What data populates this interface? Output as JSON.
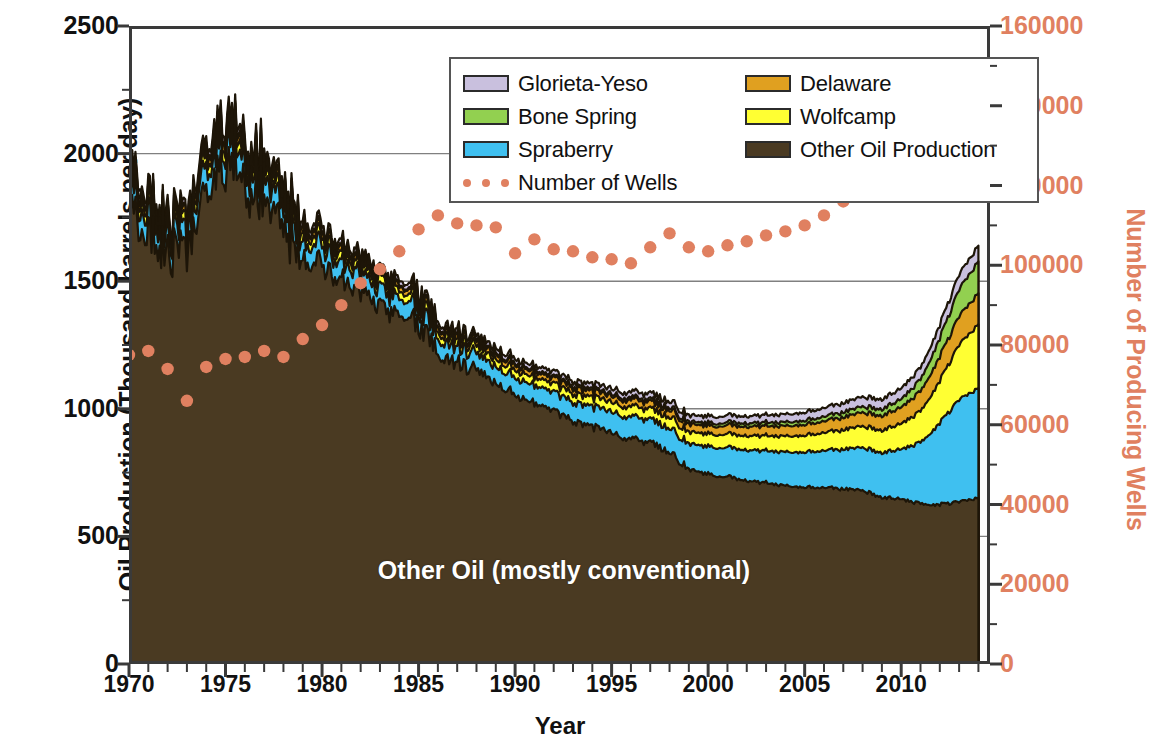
{
  "chart_data": {
    "type": "area",
    "title": "",
    "xlabel": "Year",
    "ylabel": "Oil Production (Thousand barrels per day)",
    "y2label": "Number of Producing Wells",
    "xlim": [
      1970,
      2014.6
    ],
    "ylim": [
      0,
      2500
    ],
    "y2lim": [
      0,
      160000
    ],
    "grid": "horizontal gridlines at 500/1000/1500/2000",
    "legend_position": "top-center inside plot",
    "xticks": [
      "1970",
      "1975",
      "1980",
      "1985",
      "1990",
      "1995",
      "2000",
      "2005",
      "2010"
    ],
    "xtick_values": [
      1970,
      1975,
      1980,
      1985,
      1990,
      1995,
      2000,
      2005,
      2010
    ],
    "yticks": [
      "0",
      "500",
      "1000",
      "1500",
      "2000",
      "2500"
    ],
    "ytick_values": [
      0,
      500,
      1000,
      1500,
      2000,
      2500
    ],
    "y2ticks": [
      "0",
      "20000",
      "40000",
      "60000",
      "80000",
      "100000",
      "120000",
      "140000",
      "160000"
    ],
    "y2tick_values": [
      0,
      20000,
      40000,
      60000,
      80000,
      100000,
      120000,
      140000,
      160000
    ],
    "stack_order_bottom_to_top": [
      "Other Oil Production",
      "Spraberry",
      "Wolfcamp",
      "Delaware",
      "Bone Spring",
      "Glorieta-Yeso"
    ],
    "x": [
      1970,
      1971,
      1972,
      1973,
      1974,
      1975,
      1976,
      1977,
      1978,
      1979,
      1980,
      1981,
      1982,
      1983,
      1984,
      1985,
      1986,
      1987,
      1988,
      1989,
      1990,
      1991,
      1992,
      1993,
      1994,
      1995,
      1996,
      1997,
      1998,
      1999,
      2000,
      2001,
      2002,
      2003,
      2004,
      2005,
      2006,
      2007,
      2008,
      2009,
      2010,
      2011,
      2012,
      2013,
      2014
    ],
    "series": [
      {
        "name": "Other Oil Production",
        "color": "#4a3a22",
        "values": [
          1760,
          1700,
          1610,
          1600,
          1880,
          1930,
          1900,
          1820,
          1690,
          1620,
          1560,
          1500,
          1460,
          1400,
          1380,
          1330,
          1230,
          1180,
          1150,
          1100,
          1060,
          1020,
          990,
          950,
          930,
          905,
          880,
          865,
          835,
          760,
          745,
          735,
          720,
          710,
          700,
          695,
          690,
          685,
          680,
          655,
          645,
          630,
          625,
          635,
          650
        ]
      },
      {
        "name": "Spraberry",
        "color": "#3fc0f0",
        "values": [
          80,
          78,
          72,
          70,
          88,
          90,
          88,
          84,
          78,
          74,
          72,
          70,
          68,
          66,
          66,
          64,
          62,
          62,
          64,
          66,
          68,
          70,
          72,
          74,
          78,
          82,
          86,
          90,
          95,
          100,
          108,
          115,
          120,
          126,
          132,
          138,
          145,
          155,
          168,
          175,
          195,
          240,
          320,
          400,
          430
        ]
      },
      {
        "name": "Wolfcamp",
        "color": "#ffff33",
        "values": [
          38,
          37,
          34,
          33,
          41,
          42,
          41,
          39,
          36,
          34,
          33,
          32,
          31,
          30,
          30,
          29,
          28,
          28,
          29,
          30,
          31,
          32,
          33,
          34,
          36,
          38,
          40,
          42,
          44,
          46,
          50,
          53,
          56,
          59,
          62,
          66,
          70,
          76,
          84,
          88,
          100,
          122,
          165,
          215,
          250
        ]
      },
      {
        "name": "Delaware",
        "color": "#e0a020",
        "values": [
          24,
          23,
          21,
          21,
          26,
          27,
          26,
          25,
          23,
          22,
          21,
          20,
          20,
          19,
          19,
          19,
          18,
          18,
          19,
          19,
          20,
          20,
          21,
          22,
          23,
          24,
          26,
          27,
          28,
          30,
          32,
          34,
          36,
          38,
          40,
          42,
          45,
          49,
          54,
          57,
          64,
          78,
          95,
          112,
          122
        ]
      },
      {
        "name": "Bone Spring",
        "color": "#92d050",
        "values": [
          8,
          8,
          7,
          7,
          9,
          9,
          9,
          8,
          8,
          7,
          7,
          7,
          7,
          6,
          6,
          6,
          6,
          6,
          6,
          7,
          7,
          7,
          7,
          8,
          8,
          8,
          9,
          9,
          10,
          10,
          11,
          12,
          13,
          14,
          15,
          16,
          18,
          20,
          23,
          26,
          32,
          46,
          72,
          105,
          125
        ]
      },
      {
        "name": "Glorieta-Yeso",
        "color": "#c9c0de",
        "values": [
          22,
          21,
          20,
          19,
          24,
          25,
          24,
          23,
          21,
          20,
          20,
          19,
          19,
          18,
          18,
          17,
          17,
          17,
          17,
          18,
          18,
          18,
          19,
          19,
          20,
          21,
          22,
          23,
          24,
          25,
          26,
          27,
          28,
          29,
          31,
          32,
          34,
          36,
          38,
          39,
          42,
          46,
          52,
          58,
          62
        ]
      }
    ],
    "overlay_series": {
      "name": "Number of  Wells",
      "color": "#e08060",
      "axis": "right",
      "marker": "round dots",
      "values": [
        77500,
        78500,
        74000,
        66000,
        74500,
        76500,
        77000,
        78500,
        77000,
        81500,
        85000,
        90000,
        95500,
        99000,
        103500,
        109000,
        112500,
        110500,
        110000,
        109500,
        103000,
        106500,
        104000,
        103500,
        102000,
        101500,
        100500,
        104500,
        108000,
        104500,
        103500,
        105000,
        106000,
        107500,
        108500,
        110000,
        112500,
        116000,
        120500,
        123500,
        126000,
        130000,
        133500,
        139000,
        145000
      ]
    },
    "annotation": "Other Oil (mostly conventional)"
  },
  "legend": {
    "entries": [
      {
        "label": "Glorieta-Yeso",
        "color": "#c9c0de",
        "type": "swatch"
      },
      {
        "label": "Delaware",
        "color": "#e0a020",
        "type": "swatch"
      },
      {
        "label": "Bone Spring",
        "color": "#92d050",
        "type": "swatch"
      },
      {
        "label": "Wolfcamp",
        "color": "#ffff33",
        "type": "swatch"
      },
      {
        "label": "Spraberry",
        "color": "#3fc0f0",
        "type": "swatch"
      },
      {
        "label": "Other Oil Production",
        "color": "#4a3a22",
        "type": "swatch"
      },
      {
        "label": "Number of  Wells",
        "color": "#e08060",
        "type": "dots"
      }
    ]
  },
  "colors": {
    "axis_left": "#111111",
    "axis_right": "#e08060",
    "frame": "#3a3a3a",
    "grid": "#808080",
    "annotation_text": "#ffffff"
  }
}
